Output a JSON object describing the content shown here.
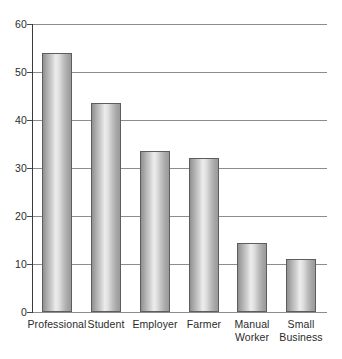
{
  "chart_data": {
    "type": "bar",
    "title": "",
    "subtitle": "",
    "xlabel": "",
    "ylabel": "",
    "ylim": [
      0,
      60
    ],
    "ytick_values": [
      60,
      50,
      40,
      30,
      20,
      10,
      0
    ],
    "ytick_labels": [
      "60",
      "50",
      "40",
      "30",
      "20",
      "10",
      "0"
    ],
    "grid": true,
    "grid_axis": "y",
    "legend": false,
    "legend_position": "none",
    "categories": [
      "Professional",
      "Student",
      "Employer",
      "Farmer",
      "Manual Worker",
      "Small Business"
    ],
    "category_lines": [
      [
        "Professional"
      ],
      [
        "Student"
      ],
      [
        "Employer"
      ],
      [
        "Farmer"
      ],
      [
        "Manual",
        "Worker"
      ],
      [
        "Small",
        "Business"
      ]
    ],
    "values": [
      54,
      43.5,
      33.5,
      32,
      14.3,
      11
    ],
    "bar_color": "#c8c8c8",
    "bar_edge_color": "#5d5d5d",
    "gridline_color": "#8d8d8d",
    "axis_color": "#3a3a3a",
    "background_color": "#ffffff",
    "text_color": "#2b2b2b"
  }
}
